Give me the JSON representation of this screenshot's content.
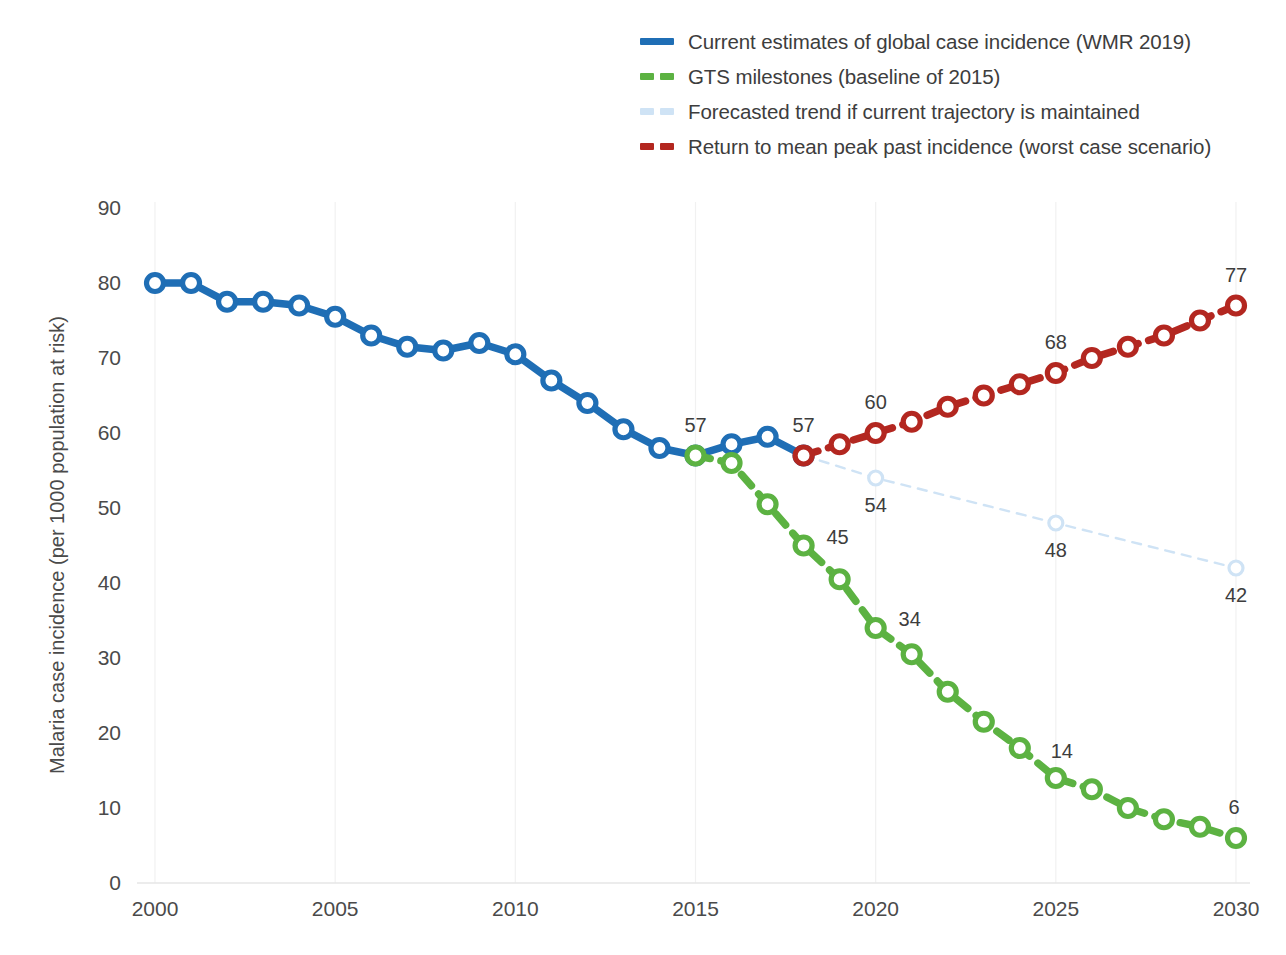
{
  "chart_data": {
    "type": "line",
    "title": "",
    "xlabel": "",
    "ylabel": "Malaria case incidence (per 1000 population at risk)",
    "xlim": [
      2000,
      2030
    ],
    "ylim": [
      0,
      90
    ],
    "ytick_labels": [
      "0",
      "10",
      "20",
      "30",
      "40",
      "50",
      "60",
      "70",
      "80",
      "90"
    ],
    "ytick_values": [
      0,
      10,
      20,
      30,
      40,
      50,
      60,
      70,
      80,
      90
    ],
    "xtick_labels": [
      "2000",
      "2005",
      "2010",
      "2015",
      "2020",
      "2025",
      "2030"
    ],
    "xtick_values": [
      2000,
      2005,
      2010,
      2015,
      2020,
      2025,
      2030
    ],
    "grid": false,
    "legend_position": "top-right",
    "series": [
      {
        "name": "Current estimates of global case incidence (WMR 2019)",
        "legend_key": "current-estimates",
        "color": "#1f6eb5",
        "style": "solid",
        "marker": "open-circle",
        "x": [
          2000,
          2001,
          2002,
          2003,
          2004,
          2005,
          2006,
          2007,
          2008,
          2009,
          2010,
          2011,
          2012,
          2013,
          2014,
          2015,
          2016,
          2017,
          2018
        ],
        "values": [
          80,
          80,
          77.5,
          77.5,
          77,
          75.5,
          73,
          71.5,
          71,
          72,
          70.5,
          67,
          64,
          60.5,
          58,
          57,
          58.5,
          59.5,
          57
        ],
        "labels": [
          {
            "x": 2015,
            "value": 57,
            "text": "57"
          },
          {
            "x": 2018,
            "value": 57,
            "text": "57"
          }
        ]
      },
      {
        "name": "GTS milestones (baseline of 2015)",
        "legend_key": "gts-milestones",
        "color": "#5cb242",
        "style": "dashed",
        "marker": "open-circle",
        "x": [
          2015,
          2016,
          2017,
          2018,
          2019,
          2020,
          2021,
          2022,
          2023,
          2024,
          2025,
          2026,
          2027,
          2028,
          2029,
          2030
        ],
        "values": [
          57,
          56,
          50.5,
          45,
          40.5,
          34,
          30.5,
          25.5,
          21.5,
          18,
          14,
          12.5,
          10,
          8.5,
          7.5,
          6
        ],
        "labels": [
          {
            "x": 2018,
            "value": 45,
            "text": "45"
          },
          {
            "x": 2020,
            "value": 34,
            "text": "34"
          },
          {
            "x": 2025,
            "value": 14,
            "text": "14"
          },
          {
            "x": 2030,
            "value": 6,
            "text": "6"
          }
        ]
      },
      {
        "name": "Forecasted trend if current trajectory is maintained",
        "legend_key": "forecasted-trend",
        "color": "#cfe3f5",
        "style": "dashed",
        "marker": "open-circle",
        "x": [
          2018,
          2020,
          2025,
          2030
        ],
        "values": [
          57,
          54,
          48,
          42
        ],
        "labels": [
          {
            "x": 2020,
            "value": 54,
            "text": "54"
          },
          {
            "x": 2025,
            "value": 48,
            "text": "48"
          },
          {
            "x": 2030,
            "value": 42,
            "text": "42"
          }
        ]
      },
      {
        "name": "Return to mean peak past incidence (worst case scenario)",
        "legend_key": "worst-case",
        "color": "#b32720",
        "style": "dashed",
        "marker": "open-circle",
        "x": [
          2018,
          2019,
          2020,
          2021,
          2022,
          2023,
          2024,
          2025,
          2026,
          2027,
          2028,
          2029,
          2030
        ],
        "values": [
          57,
          58.5,
          60,
          61.5,
          63.5,
          65,
          66.5,
          68,
          70,
          71.5,
          73,
          75,
          77
        ],
        "labels": [
          {
            "x": 2020,
            "value": 60,
            "text": "60"
          },
          {
            "x": 2025,
            "value": 68,
            "text": "68"
          },
          {
            "x": 2030,
            "value": 77,
            "text": "77"
          }
        ]
      }
    ]
  },
  "legend": {
    "items": [
      {
        "label": "Current estimates of global case incidence (WMR 2019)",
        "color": "#1f6eb5",
        "style": "solid"
      },
      {
        "label": "GTS milestones (baseline of 2015)",
        "color": "#5cb242",
        "style": "dashed"
      },
      {
        "label": "Forecasted trend if current trajectory is maintained",
        "color": "#cfe3f5",
        "style": "dashed"
      },
      {
        "label": "Return to mean peak past incidence (worst case scenario)",
        "color": "#b32720",
        "style": "dashed"
      }
    ]
  },
  "axes": {
    "y_title": "Malaria case incidence (per 1000 population at risk)"
  }
}
